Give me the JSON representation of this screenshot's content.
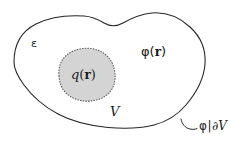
{
  "figure": {
    "kind": "physics-diagram",
    "background_color": "#ffffff",
    "outer_boundary": {
      "name": "outer-region-contour",
      "stroke_color": "#262626",
      "fill_color": "#ffffff",
      "stroke_width": 1.1
    },
    "inner_blob": {
      "name": "charge-region",
      "stroke_color": "#555555",
      "stroke_style": "dotted",
      "fill_color": "#d4d4d4",
      "stroke_width": 1.1
    },
    "leader_line": {
      "name": "boundary-leader-line",
      "stroke_color": "#262626"
    }
  },
  "labels": {
    "permittivity": "ε",
    "outer_potential": {
      "symbol": "φ",
      "open_paren": "(",
      "vector": "r",
      "close_paren": ")"
    },
    "charge_density": {
      "symbol": "q",
      "open_paren": "(",
      "vector": "r",
      "close_paren": ")"
    },
    "volume": "V",
    "boundary_condition": {
      "symbol": "φ",
      "bar": "|",
      "partial": "∂",
      "surface": "V"
    }
  }
}
